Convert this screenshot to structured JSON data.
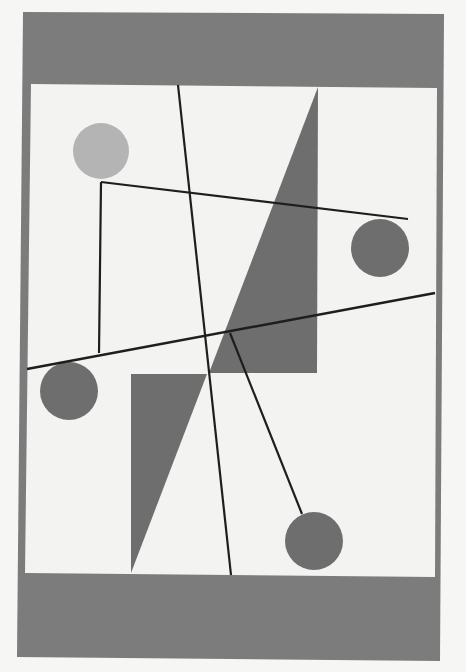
{
  "artwork": {
    "description": "Abstract geometric composition: gray frame bands, white field, circles, triangles and black lines",
    "colors": {
      "page_background": "#f6f6f4",
      "frame_gray": "#7c7c7c",
      "field_white": "#f3f3f1",
      "shape_gray": "#6e6e6e",
      "light_circle": "#b4b4b4",
      "line_black": "#1e1e1e"
    },
    "frame": {
      "outer": {
        "x": 22,
        "y": 12,
        "w": 422,
        "h": 648
      },
      "field": {
        "x": 30,
        "y": 84,
        "w": 406,
        "h": 491
      }
    },
    "circles": [
      {
        "name": "light-circle-top-left",
        "cx": 101,
        "cy": 151,
        "r": 28,
        "color": "#b4b4b4"
      },
      {
        "name": "circle-right",
        "cx": 380,
        "cy": 248,
        "r": 29,
        "color": "#6e6e6e"
      },
      {
        "name": "circle-left",
        "cx": 69,
        "cy": 391,
        "r": 29,
        "color": "#6e6e6e"
      },
      {
        "name": "circle-bottom",
        "cx": 314,
        "cy": 541,
        "r": 29,
        "color": "#6e6e6e"
      }
    ],
    "triangles": [
      {
        "name": "triangle-upper",
        "points": "318,87 317,373 209,373"
      },
      {
        "name": "triangle-lower",
        "points": "131,374 207,374 131,573"
      }
    ],
    "lines": [
      {
        "name": "line-long-vertical",
        "x1": 178,
        "y1": 85,
        "x2": 231,
        "y2": 575,
        "w": 2.2
      },
      {
        "name": "line-upper-diagonal",
        "x1": 101,
        "y1": 182,
        "x2": 408,
        "y2": 219,
        "w": 2.2
      },
      {
        "name": "line-left-vertical",
        "x1": 101,
        "y1": 182,
        "x2": 99,
        "y2": 353,
        "w": 2.2
      },
      {
        "name": "line-lower-diagonal",
        "x1": 27,
        "y1": 369,
        "x2": 435,
        "y2": 293,
        "w": 2.4
      },
      {
        "name": "line-pendulum",
        "x1": 230,
        "y1": 333,
        "x2": 302,
        "y2": 514,
        "w": 2.2
      }
    ]
  }
}
